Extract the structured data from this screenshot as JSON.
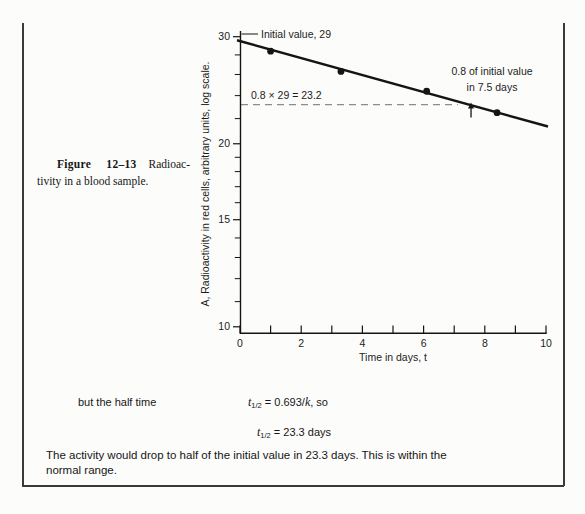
{
  "page": {
    "running_head_clipped": "12–9 EXPONENTIAL RELATIONS",
    "page_number_clipped": "401"
  },
  "caption": {
    "bold_label": "Figure 12–13",
    "line1_rest": " Radioac-",
    "line2": "tivity in a blood sample."
  },
  "chart_data": {
    "type": "scatter",
    "title": "",
    "xlabel": "Time in days, t",
    "ylabel": "A, Radioactivity in red cells, arbitrary units, log scale.",
    "xlim": [
      0,
      10
    ],
    "ylim": [
      10,
      30
    ],
    "y_scale": "log",
    "grid": false,
    "legend": false,
    "x_ticks": [
      0,
      1,
      2,
      3,
      4,
      5,
      6,
      7,
      8,
      9,
      10
    ],
    "x_tick_labels": [
      {
        "t": 0,
        "label": "0"
      },
      {
        "t": 2,
        "label": "2"
      },
      {
        "t": 4,
        "label": "4"
      },
      {
        "t": 6,
        "label": "6"
      },
      {
        "t": 8,
        "label": "8"
      },
      {
        "t": 10,
        "label": "10"
      }
    ],
    "y_major_ticks": [
      {
        "A": 30,
        "label": "30"
      },
      {
        "A": 20,
        "label": "20"
      },
      {
        "A": 15,
        "label": "15"
      },
      {
        "A": 10,
        "label": "10"
      }
    ],
    "y_minor_ticks": [
      28,
      26,
      24,
      22,
      19,
      18,
      17,
      16,
      14,
      13,
      12,
      11
    ],
    "points": [
      {
        "t": 1.0,
        "A": 28.4
      },
      {
        "t": 3.3,
        "A": 26.3
      },
      {
        "t": 6.1,
        "A": 24.4
      },
      {
        "t": 8.4,
        "A": 22.5
      }
    ],
    "fit_line": {
      "t_start": 0,
      "A_start": 29.6,
      "t_end": 10,
      "A_end": 21.35
    },
    "dashed_guide": {
      "A": 23.2,
      "t_start": 0,
      "t_end": 7.12
    },
    "arrow_marker": {
      "t": 7.55,
      "A": 23.2
    },
    "annotations": {
      "initial_value": "Initial value, 29",
      "calc": "0.8 × 29 = 23.2",
      "drop_line1": "0.8 of initial value",
      "drop_line2": "in 7.5 days"
    }
  },
  "body": {
    "intro": "but the half time",
    "eq1": {
      "var": "t",
      "sub": "1/2",
      "mid": " = 0.693/",
      "var2": "k",
      "tail": ", so"
    },
    "eq2": {
      "var": "t",
      "sub": "1/2",
      "rest": " = 23.3 days"
    },
    "paragraph": "The activity would drop to half of the initial value in 23.3 days. This is within the normal range."
  }
}
